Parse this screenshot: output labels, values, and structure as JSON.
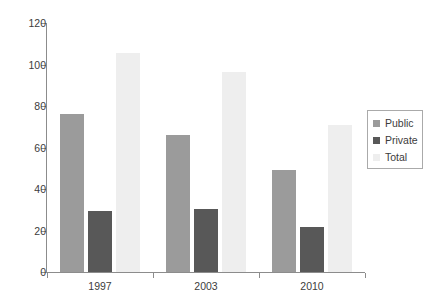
{
  "chart_data": {
    "type": "bar",
    "title": "",
    "subtitle": "",
    "xlabel": "",
    "ylabel": "",
    "categories": [
      "1997",
      "2003",
      "2010"
    ],
    "series": [
      {
        "name": "Public",
        "color": "#9b9b9b",
        "values": [
          76,
          66,
          49
        ]
      },
      {
        "name": "Private",
        "color": "#585858",
        "values": [
          29.5,
          30.5,
          21.5
        ]
      },
      {
        "name": "Total",
        "color": "#eeeeee",
        "values": [
          105.5,
          96.5,
          71
        ]
      }
    ],
    "ylim": [
      0,
      120
    ],
    "ytick_values": [
      0,
      20,
      40,
      60,
      80,
      100,
      120
    ],
    "ytick_labels": [
      "0",
      "20",
      "40",
      "60",
      "80",
      "100",
      "120"
    ],
    "xtick_labels": [
      "1997",
      "2003",
      "2010"
    ],
    "grid": false,
    "legend": {
      "position": "right",
      "bordered": true,
      "entries": [
        {
          "label": "Public",
          "color": "#9b9b9b"
        },
        {
          "label": "Private",
          "color": "#585858"
        },
        {
          "label": "Total",
          "color": "#eeeeee"
        }
      ]
    },
    "axis_color": "#8c8c8c",
    "background": "#ffffff"
  }
}
